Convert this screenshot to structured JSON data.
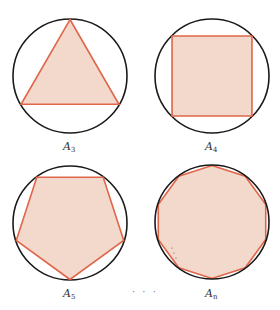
{
  "figure": {
    "colors": {
      "circle_stroke": "#1a1a1a",
      "polygon_stroke": "#e0664a",
      "polygon_fill": "#f2d9cc"
    },
    "panels": [
      {
        "id": "A3",
        "label": "A",
        "subscript": "3",
        "sides": 3,
        "cx": 70,
        "cy": 76,
        "r": 57,
        "rotation_deg": -90
      },
      {
        "id": "A4",
        "label": "A",
        "subscript": "4",
        "sides": 4,
        "cx": 212,
        "cy": 76,
        "r": 57,
        "rotation_deg": -135
      },
      {
        "id": "A5",
        "label": "A",
        "subscript": "5",
        "sides": 5,
        "cx": 70,
        "cy": 223,
        "r": 57,
        "rotation_deg": 90
      },
      {
        "id": "An",
        "label": "A",
        "subscript": "n",
        "sides": 10,
        "cx": 212,
        "cy": 222,
        "r": 57,
        "rotation_deg": -90
      }
    ],
    "ellipsis": "· · ·"
  }
}
